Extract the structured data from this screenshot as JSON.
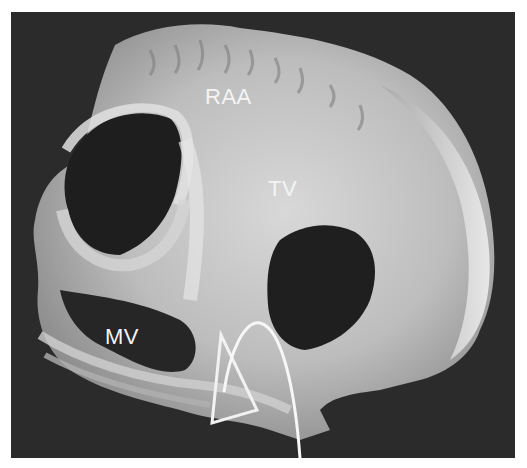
{
  "figure": {
    "type": "anatomical photograph (heart specimen, grayscale)",
    "background_color": "#2b2b2b",
    "page_background": "#ffffff",
    "labels": [
      {
        "id": "raa",
        "text": "RAA",
        "x": 205,
        "y": 85
      },
      {
        "id": "tv",
        "text": "TV",
        "x": 268,
        "y": 177
      },
      {
        "id": "mv",
        "text": "MV",
        "x": 105,
        "y": 325
      }
    ],
    "annotations": {
      "triangle_outline": {
        "color": "#ffffff",
        "points": [
          [
            221,
            335
          ],
          [
            212,
            423
          ],
          [
            257,
            410
          ]
        ]
      },
      "curved_line": {
        "color": "#ffffff",
        "path": "catheter-shaped arc from lower-left inside triangle rising to peak then descending off bottom edge"
      }
    }
  }
}
